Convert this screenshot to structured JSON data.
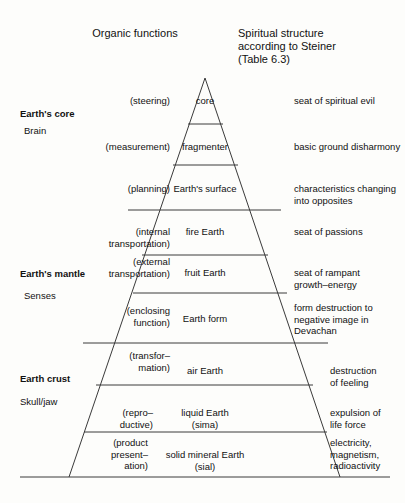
{
  "figure": {
    "type": "pyramid-layer-diagram",
    "columns": {
      "left_header": "Organic functions",
      "right_header_line1": "Spiritual structure",
      "right_header_line2": "according to Steiner",
      "right_header_line3": "(Table 6.3)"
    },
    "geology_labels": [
      {
        "label": "Earth's core",
        "bold": true
      },
      {
        "label": "Brain",
        "bold": false
      },
      {
        "label": "Earth's mantle",
        "bold": true
      },
      {
        "label": "Senses",
        "bold": false
      },
      {
        "label": "Earth crust",
        "bold": true
      },
      {
        "label": "Skull/jaw",
        "bold": false
      }
    ],
    "layers": [
      {
        "name": "core",
        "organic_function": "(steering)",
        "spiritual": "seat of spiritual evil"
      },
      {
        "name": "fragmenter",
        "organic_function": "(measurement)",
        "spiritual": "basic ground disharmony"
      },
      {
        "name": "Earth's surface",
        "organic_function": "(planning)",
        "spiritual": "characteristics changing\ninto opposites"
      },
      {
        "name": "fire Earth",
        "organic_function": "(internal\ntransportation)",
        "spiritual": "seat of passions"
      },
      {
        "name": "fruit Earth",
        "organic_function": "(external\ntransportation)",
        "spiritual": "seat of rampant\ngrowth–energy"
      },
      {
        "name": "Earth form",
        "organic_function": "(enclosing\nfunction)",
        "spiritual": "form destruction to\nnegative image in\nDevachan"
      },
      {
        "name": "air Earth",
        "organic_function": "(transfor–\nmation)",
        "spiritual": "destruction\nof feeling"
      },
      {
        "name": "liquid Earth\n(sima)",
        "organic_function": "(repro–\nductive)",
        "spiritual": "expulsion of\nlife force"
      },
      {
        "name": "solid mineral Earth\n(sial)",
        "organic_function": "(product\npresent–\nation)",
        "spiritual": "electricity,\nmagnetism,\nradioactivity"
      }
    ],
    "colors": {
      "line": "#3a3a3a",
      "text": "#111111",
      "background": "#fdfdfb"
    }
  }
}
